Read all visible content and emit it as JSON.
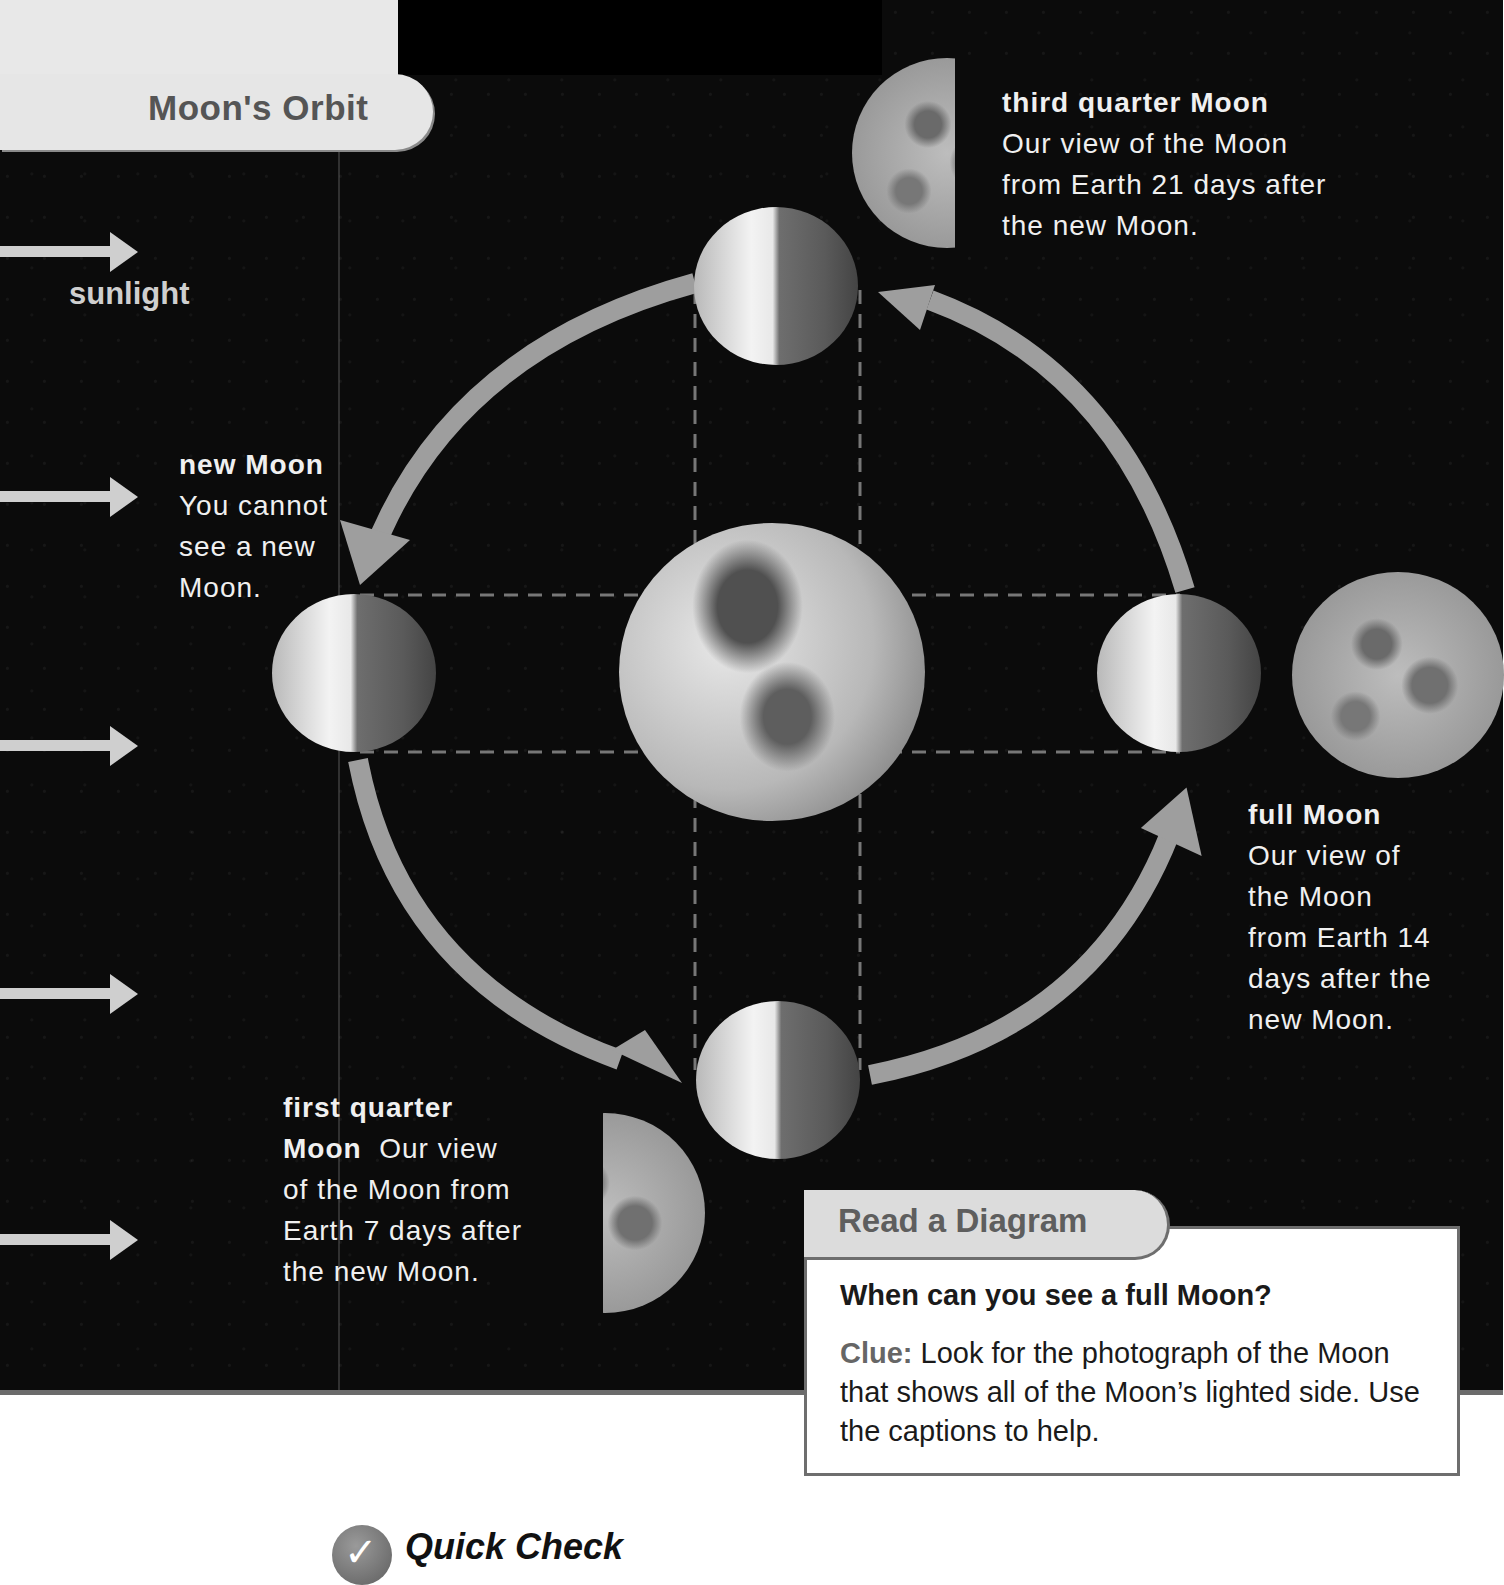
{
  "title": "Moon's Orbit",
  "sunlight_label": "sunlight",
  "sunlight_arrows": [
    {
      "y": 232
    },
    {
      "y": 477
    },
    {
      "y": 726
    },
    {
      "y": 974
    },
    {
      "y": 1220
    }
  ],
  "phases": {
    "new": {
      "name": "new Moon",
      "text_lines": [
        "You cannot",
        "see a new",
        "Moon."
      ]
    },
    "first_quarter": {
      "name_line1": "first quarter",
      "name_line2": "Moon",
      "text_line2_rest": "Our view",
      "text_lines": [
        "of the Moon from",
        "Earth 7 days after",
        "the new Moon."
      ]
    },
    "full": {
      "name": "full Moon",
      "text_lines": [
        "Our view of",
        "the Moon",
        "from Earth 14",
        "days after the",
        "new Moon."
      ]
    },
    "third_quarter": {
      "name": "third quarter Moon",
      "text_lines": [
        "Our view of the Moon",
        "from Earth 21 days after",
        "the new Moon."
      ]
    }
  },
  "read_a_diagram": {
    "title": "Read a Diagram",
    "question": "When can you see a full Moon?",
    "clue_label": "Clue:",
    "clue_text": " Look for the photograph of the Moon that shows all of the Moon’s lighted side. Use the captions to help."
  },
  "quick_check": {
    "title": "Quick Check",
    "icon": "checkmark-icon"
  },
  "colors": {
    "space": "#0b0b0b",
    "arrow": "#cfcfcf",
    "orbit_arrow": "#9e9e9e",
    "title_text": "#555555",
    "box_border": "#6e6e6e"
  }
}
